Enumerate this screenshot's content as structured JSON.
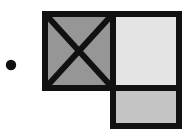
{
  "figure": {
    "background_color": "#ffffff",
    "stroke_color": "#111111",
    "canvas": {
      "width": 184,
      "height": 140
    },
    "marker": {
      "name": "bullet-dot",
      "shape": "circle",
      "cx": 11,
      "cy": 65,
      "r": 5.2,
      "fill": "#111111"
    },
    "cells": [
      {
        "name": "crossed-square",
        "label": "crossed square",
        "x": 45,
        "y": 14,
        "width": 68,
        "height": 74,
        "fill": "#969696",
        "stroke_width": 6,
        "diagonals": true
      },
      {
        "name": "light-square",
        "label": "light square",
        "x": 113,
        "y": 14,
        "width": 66,
        "height": 74,
        "fill": "#e4e4e4",
        "stroke_width": 6,
        "diagonals": false
      },
      {
        "name": "medium-square",
        "label": "medium square",
        "x": 113,
        "y": 88,
        "width": 66,
        "height": 38,
        "fill": "#c4c4c4",
        "stroke_width": 6,
        "diagonals": false
      }
    ],
    "cross_lines": [
      {
        "name": "diagonal-down-right",
        "x1": 48,
        "y1": 17,
        "x2": 110,
        "y2": 85
      },
      {
        "name": "diagonal-up-right",
        "x1": 48,
        "y1": 85,
        "x2": 110,
        "y2": 17
      }
    ],
    "cross_stroke_width": 6
  }
}
